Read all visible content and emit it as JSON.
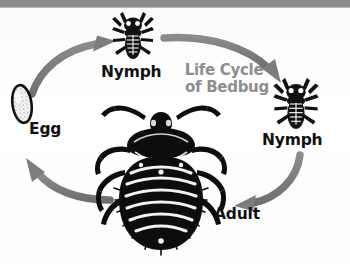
{
  "diagram": {
    "title_line1": "Life Cycle",
    "title_line2": "of Bedbug",
    "title_color": "#8e8e8e",
    "arrow_color": "#808080",
    "ink_color": "#0d0d0d",
    "background_color": "#fdfdfd",
    "top_band_color": "#8c8c8c",
    "stages": [
      {
        "id": "egg",
        "label": "Egg",
        "icon": "bedbug-egg-icon"
      },
      {
        "id": "nymph-top",
        "label": "Nymph",
        "icon": "bedbug-nymph-icon"
      },
      {
        "id": "nymph-right",
        "label": "Nymph",
        "icon": "bedbug-nymph-icon"
      },
      {
        "id": "adult",
        "label": "Adult",
        "icon": "bedbug-adult-icon"
      }
    ],
    "arrows": [
      {
        "id": "egg-to-nymph-top",
        "from": "egg",
        "to": "nymph-top",
        "icon": "curved-arrow-icon"
      },
      {
        "id": "nymph-top-to-nymph-right",
        "from": "nymph-top",
        "to": "nymph-right",
        "icon": "curved-arrow-icon"
      },
      {
        "id": "nymph-right-to-adult",
        "from": "nymph-right",
        "to": "adult",
        "icon": "curved-arrow-icon"
      },
      {
        "id": "adult-to-egg",
        "from": "adult",
        "to": "egg",
        "icon": "curved-arrow-icon"
      }
    ]
  }
}
